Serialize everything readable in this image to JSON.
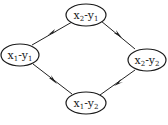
{
  "diagram": {
    "type": "directed-graph",
    "colors": {
      "stroke": "#1a1a1a",
      "background": "#ffffff"
    },
    "nodes": [
      {
        "id": "top",
        "var": "x",
        "var_sub": "2",
        "sep": "-",
        "var2": "y",
        "var2_sub": "1",
        "label": "x2-y1"
      },
      {
        "id": "left",
        "var": "x",
        "var_sub": "1",
        "sep": "-",
        "var2": "y",
        "var2_sub": "1",
        "label": "x1-y1"
      },
      {
        "id": "right",
        "var": "x",
        "var_sub": "2",
        "sep": "-",
        "var2": "y",
        "var2_sub": "2",
        "label": "x2-y2"
      },
      {
        "id": "bottom",
        "var": "x",
        "var_sub": "1",
        "sep": "-",
        "var2": "y",
        "var2_sub": "2",
        "label": "x1-y2"
      }
    ],
    "edges": [
      {
        "from": "top",
        "to": "left"
      },
      {
        "from": "top",
        "to": "right"
      },
      {
        "from": "left",
        "to": "bottom"
      },
      {
        "from": "right",
        "to": "bottom"
      }
    ]
  }
}
